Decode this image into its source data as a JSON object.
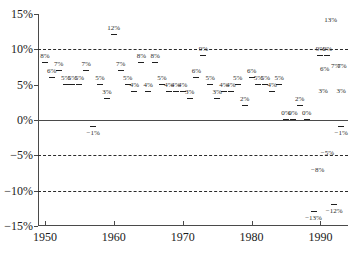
{
  "chart_data": {
    "type": "scatter",
    "title": "",
    "xlabel": "",
    "ylabel": "",
    "xlim": [
      1949,
      1994
    ],
    "ylim": [
      -15,
      15
    ],
    "grid": true,
    "gridlines_dashed": [
      10,
      -5,
      -10
    ],
    "gridlines_solid": [
      0
    ],
    "legend": "none",
    "y_ticks": [
      {
        "value": 15,
        "label": "15%"
      },
      {
        "value": 10,
        "label": "10%"
      },
      {
        "value": 5,
        "label": "5%"
      },
      {
        "value": 0,
        "label": "0%"
      },
      {
        "value": -5,
        "label": "−5%"
      },
      {
        "value": -10,
        "label": "−10%"
      },
      {
        "value": -15,
        "label": "−15%"
      }
    ],
    "x_ticks": [
      {
        "value": 1950,
        "label": "1950"
      },
      {
        "value": 1960,
        "label": "1960"
      },
      {
        "value": 1970,
        "label": "1970"
      },
      {
        "value": 1980,
        "label": "1980"
      },
      {
        "value": 1990,
        "label": "1990"
      }
    ],
    "x": [
      1950,
      1951,
      1952,
      1953,
      1954,
      1955,
      1956,
      1957,
      1958,
      1959,
      1960,
      1961,
      1962,
      1963,
      1964,
      1965,
      1966,
      1967,
      1968,
      1969,
      1970,
      1971,
      1972,
      1973,
      1974,
      1975,
      1976,
      1977,
      1978,
      1979,
      1980,
      1981,
      1982,
      1983,
      1984,
      1985,
      1986,
      1987,
      1988,
      1989,
      1990,
      1991,
      1992,
      1993
    ],
    "values": [
      8,
      6,
      7,
      5,
      5,
      5,
      7,
      -1,
      5,
      3,
      12,
      7,
      5,
      4,
      8,
      4,
      8,
      5,
      4,
      4,
      4,
      3,
      6,
      9,
      5,
      3,
      4,
      4,
      5,
      2,
      6,
      5,
      5,
      4,
      5,
      0,
      0,
      2,
      0,
      -13,
      9,
      9,
      -12,
      -1
    ],
    "labels": [
      "8%",
      "6%",
      "7%",
      "5%",
      "5%",
      "5%",
      "7%",
      "−1%",
      "5%",
      "3%",
      "12%",
      "7%",
      "5%",
      "4%",
      "8%",
      "4%",
      "8%",
      "5%",
      "4%",
      "4%",
      "4%",
      "3%",
      "6%",
      "9%",
      "5%",
      "3%",
      "4%",
      "4%",
      "5%",
      "2%",
      "6%",
      "5%",
      "5%",
      "4%",
      "5%",
      "0%",
      "0%",
      "2%",
      "0%",
      "−13%",
      "9%",
      "9%",
      "−12%",
      "−1%"
    ],
    "annotations": [
      {
        "label": "13%",
        "x": 1991.5,
        "y": 13.2
      },
      {
        "label": "6%",
        "x": 1990.6,
        "y": 6.2
      },
      {
        "label": "7%",
        "x": 1992.2,
        "y": 6.6
      },
      {
        "label": "7%",
        "x": 1993.1,
        "y": 6.6
      },
      {
        "label": "3%",
        "x": 1990.4,
        "y": 3.1
      },
      {
        "label": "3%",
        "x": 1993.0,
        "y": 3.1
      },
      {
        "label": "−5%",
        "x": 1991.0,
        "y": -5.6
      },
      {
        "label": "−8%",
        "x": 1989.6,
        "y": -8.0
      }
    ],
    "point_markers": "short-horizontal-dash",
    "label_font_size_px": 7,
    "series_name": "annual percentage",
    "colors": {
      "axis": "#4a4a4a",
      "grid": "#2a2a2a",
      "marker": "#1f1f1f",
      "label": "#2b2b2b",
      "background": "#ffffff"
    }
  }
}
